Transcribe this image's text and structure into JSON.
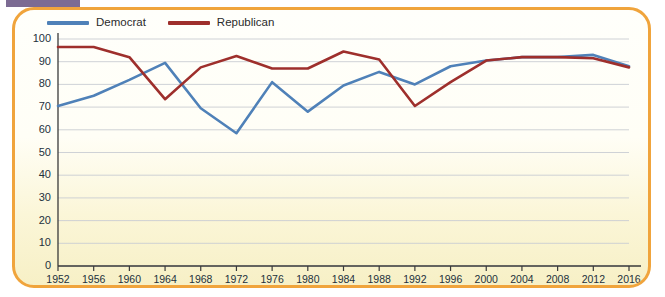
{
  "page": {
    "tab_fragment_color": "#7c6b93",
    "frame_color": "#f0a43c",
    "background_top": "#fffffb",
    "background_bottom": "#f7f0c6",
    "bleed_text": [
      "the party in the electorate has been",
      "in most states the",
      "in the past, when party loyalty was",
      "decline of the party in the electorate",
      "had begun to reverse, and the",
      "partisanship of the American voter",
      "number of voters identifying",
      "one of the two major parties",
      "of those who identify with a party",
      "loyalty at the ballot box has",
      "in recent decades"
    ]
  },
  "chart_data": {
    "type": "line",
    "title": "",
    "subtitle": "",
    "xlabel": "",
    "ylabel": "",
    "x": [
      1952,
      1956,
      1960,
      1964,
      1968,
      1972,
      1976,
      1980,
      1984,
      1988,
      1992,
      1996,
      2000,
      2004,
      2008,
      2012,
      2016
    ],
    "categories": [
      "1952",
      "1956",
      "1960",
      "1964",
      "1968",
      "1972",
      "1976",
      "1980",
      "1984",
      "1988",
      "1992",
      "1996",
      "2000",
      "2004",
      "2008",
      "2012",
      "2016"
    ],
    "ylim": [
      0,
      100
    ],
    "yticks": [
      0,
      10,
      20,
      30,
      40,
      50,
      60,
      70,
      80,
      90,
      100
    ],
    "ytick_labels": [
      "0",
      "10",
      "20",
      "30",
      "40",
      "50",
      "60",
      "70",
      "80",
      "90",
      "100"
    ],
    "grid": true,
    "grid_axis": "y",
    "legend_position": "top-left",
    "series": [
      {
        "name": "Democrat",
        "color": "#4f81b8",
        "values": [
          70.5,
          75,
          82,
          89.5,
          69.5,
          58.5,
          81,
          68,
          79.5,
          85.5,
          80,
          88,
          90.5,
          92,
          92,
          93,
          88
        ]
      },
      {
        "name": "Republican",
        "color": "#9e2f2c",
        "values": [
          96.5,
          96.5,
          92,
          73.5,
          87.5,
          92.5,
          87,
          87,
          94.5,
          91,
          70.5,
          81,
          90.5,
          92,
          92,
          91.5,
          87.5
        ]
      }
    ]
  }
}
